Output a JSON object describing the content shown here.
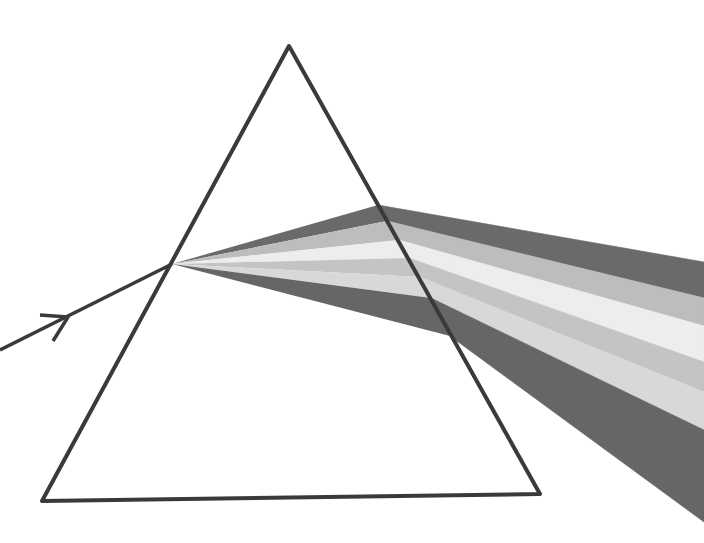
{
  "diagram": {
    "title": "",
    "description": "White light ray refracted and dispersed by a triangular prism into a spectrum of bands",
    "prism": {
      "apex": [
        289,
        46
      ],
      "base_left": [
        42,
        501
      ],
      "base_right": [
        540,
        494
      ],
      "stroke": "#3a3a3a"
    },
    "incident_ray": {
      "start": [
        0,
        350
      ],
      "end": [
        172,
        264
      ],
      "arrow_at": [
        68,
        317
      ],
      "stroke": "#3a3a3a"
    },
    "beam": {
      "entry_point": [
        172,
        264
      ],
      "bands": [
        {
          "name": "band-1",
          "fill": "#6a6a6a",
          "exit_face": [
            [
              378,
              205
            ],
            [
              387,
              221
            ]
          ],
          "edge": [
            [
              704,
              262
            ],
            [
              704,
              298
            ]
          ]
        },
        {
          "name": "band-2",
          "fill": "#bdbdbd",
          "exit_face": [
            [
              387,
              221
            ],
            [
              399,
              240
            ]
          ],
          "edge": [
            [
              704,
              298
            ],
            [
              704,
              326
            ]
          ]
        },
        {
          "name": "band-3",
          "fill": "#ededed",
          "exit_face": [
            [
              399,
              240
            ],
            [
              409,
              258
            ]
          ],
          "edge": [
            [
              704,
              326
            ],
            [
              704,
              362
            ]
          ]
        },
        {
          "name": "band-4",
          "fill": "#c4c4c4",
          "exit_face": [
            [
              409,
              258
            ],
            [
              420,
              277
            ]
          ],
          "edge": [
            [
              704,
              362
            ],
            [
              704,
              392
            ]
          ]
        },
        {
          "name": "band-5",
          "fill": "#d8d8d8",
          "exit_face": [
            [
              420,
              277
            ],
            [
              431,
              298
            ]
          ],
          "edge": [
            [
              704,
              392
            ],
            [
              704,
              430
            ]
          ]
        },
        {
          "name": "band-6",
          "fill": "#666666",
          "exit_face": [
            [
              431,
              298
            ],
            [
              450,
              336
            ]
          ],
          "edge": [
            [
              704,
              430
            ],
            [
              704,
              522
            ]
          ]
        }
      ]
    }
  }
}
